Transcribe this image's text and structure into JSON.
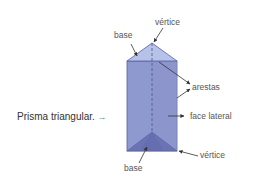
{
  "caption": {
    "text": "Prisma triangular.",
    "arrow_icon": "→"
  },
  "labels": {
    "vertex_top": "vértice",
    "base_top": "base",
    "edges": "arestas",
    "lateral_face": "face lateral",
    "vertex_bottom": "vértice",
    "base_bottom": "base"
  },
  "colors": {
    "top_face": "#b7c2e8",
    "front_face": "#8e99cf",
    "bottom_face_dark": "#6a74b4",
    "edge": "#5560a0",
    "arrow": "#333333",
    "caption_arrow": "#4caf50"
  }
}
